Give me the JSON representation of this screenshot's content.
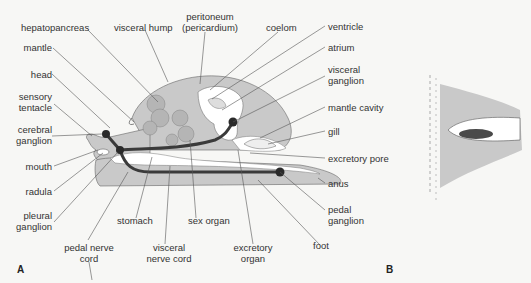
{
  "figure": {
    "panel_a_label": "A",
    "panel_b_label": "B",
    "labels": {
      "hepatopancreas": "hepatopancreas",
      "visceral_hump": "visceral hump",
      "peritoneum_1": "peritoneum",
      "peritoneum_2": "(pericardium)",
      "coelom": "coelom",
      "ventricle": "ventricle",
      "atrium": "atrium",
      "visceral_ganglion_1": "visceral",
      "visceral_ganglion_2": "ganglion",
      "mantle": "mantle",
      "mantle_cavity": "mantle cavity",
      "head": "head",
      "sensory_tentacle_1": "sensory",
      "sensory_tentacle_2": "tentacle",
      "gill": "gill",
      "cerebral_ganglion_1": "cerebral",
      "cerebral_ganglion_2": "ganglion",
      "excretory_pore": "excretory pore",
      "mouth": "mouth",
      "anus": "anus",
      "radula": "radula",
      "pleural_ganglion_1": "pleural",
      "pleural_ganglion_2": "ganglion",
      "pedal_ganglion_1": "pedal",
      "pedal_ganglion_2": "ganglion",
      "stomach": "stomach",
      "sex_organ": "sex organ",
      "foot": "foot",
      "pedal_nerve_cord_1": "pedal nerve",
      "pedal_nerve_cord_2": "cord",
      "visceral_nerve_cord_1": "visceral",
      "visceral_nerve_cord_2": "nerve cord",
      "excretory_organ_1": "excretory",
      "excretory_organ_2": "organ"
    },
    "colors": {
      "body_fill": "#c9c9c9",
      "nerve": "#3a3a3a",
      "cavity": "#ffffff",
      "line": "#555555",
      "kidney_dark": "#4a4a4a"
    }
  }
}
